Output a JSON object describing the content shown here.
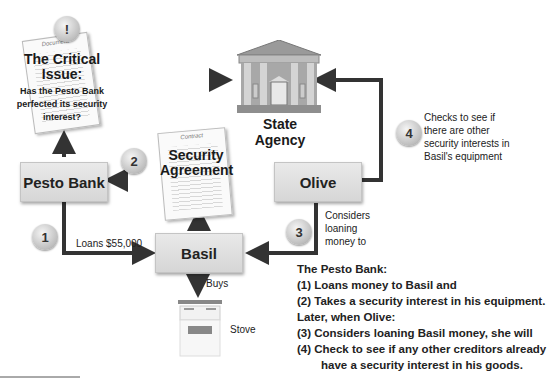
{
  "critical_issue": {
    "badge": "!",
    "doc_label": "Document",
    "title_line1": "The Critical",
    "title_line2": "Issue:",
    "question_line1": "Has the Pesto Bank",
    "question_line2": "perfected its security",
    "question_line3": "interest?"
  },
  "state_agency": {
    "label": "State Agency"
  },
  "nodes": {
    "pesto_bank": "Pesto Bank",
    "olive": "Olive",
    "basil": "Basil"
  },
  "security_agreement": {
    "doc_label": "Contract",
    "line1": "Security",
    "line2": "Agreement"
  },
  "steps": [
    {
      "number": "1",
      "text": "Loans $55,000"
    },
    {
      "number": "2",
      "text": ""
    },
    {
      "number": "3",
      "text_line1": "Considers",
      "text_line2": "loaning",
      "text_line3": "money to"
    },
    {
      "number": "4",
      "text_line1": "Checks to see if",
      "text_line2": "there are other",
      "text_line3": "security interests in",
      "text_line4": "Basil's equipment"
    }
  ],
  "stove": {
    "buys_label": "Buys",
    "label": "Stove"
  },
  "summary": {
    "heading": "The Pesto Bank:",
    "item1": "(1)  Loans money to Basil and",
    "item2": "(2)  Takes a security interest in his equipment.",
    "later": "Later, when Olive:",
    "item3": "(3)  Considers loaning Basil money, she will",
    "item4a": "(4)  Check to see if any other creditors already",
    "item4b": "have a security interest in his goods."
  }
}
